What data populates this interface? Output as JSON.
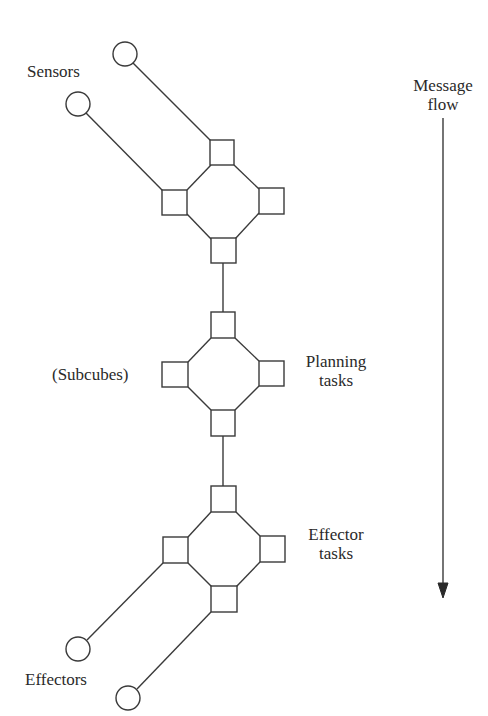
{
  "diagram": {
    "labels": {
      "sensors": "Sensors",
      "subcubes": "(Subcubes)",
      "planning_line1": "Planning",
      "planning_line2": "tasks",
      "effector_line1": "Effector",
      "effector_line2": "tasks",
      "effectors": "Effectors",
      "message_flow_line1": "Message",
      "message_flow_line2": "flow"
    },
    "groups": [
      {
        "name": "sensor-subcube",
        "nodes": 4,
        "inputs": 2
      },
      {
        "name": "planning-subcube",
        "nodes": 4
      },
      {
        "name": "effector-subcube",
        "nodes": 4,
        "outputs": 2
      }
    ],
    "arrow": {
      "direction": "down",
      "meaning": "Message flow"
    },
    "colors": {
      "stroke": "#3a3a3a",
      "background": "#ffffff",
      "text": "#2a2a2a"
    }
  }
}
